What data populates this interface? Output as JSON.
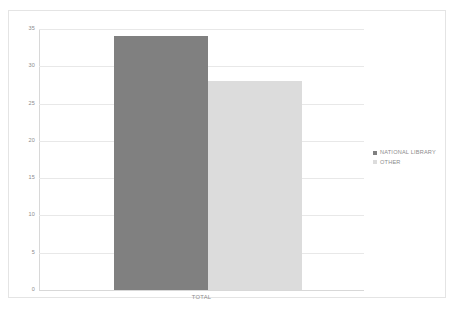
{
  "chart_data": {
    "type": "bar",
    "title": "",
    "subtitle": "",
    "xlabel": "",
    "ylabel": "",
    "categories": [
      "TOTAL"
    ],
    "series": [
      {
        "name": "NATIONAL LIBRARY",
        "values": [
          34
        ],
        "color": "#808080"
      },
      {
        "name": "OTHER",
        "values": [
          28
        ],
        "color": "#dcdcdc"
      }
    ],
    "ylim": [
      0,
      35
    ],
    "yticks": [
      0,
      5,
      10,
      15,
      20,
      25,
      30,
      35
    ],
    "ytick_labels": [
      "0",
      "5",
      "10",
      "15",
      "20",
      "25",
      "30",
      "35"
    ],
    "grid": true,
    "grid_axis": "y",
    "legend_position": "right",
    "legend_marker": "square"
  },
  "axis": {
    "tick_label_color": "#8c8c8c",
    "gridline_color": "#e8e8e8"
  },
  "frame": {
    "border_color": "#e4e4e4"
  }
}
